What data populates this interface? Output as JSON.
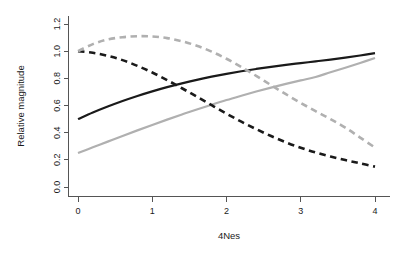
{
  "chart_data": {
    "type": "line",
    "title": "",
    "xlabel": "4Nes",
    "ylabel": "Relative magnitude",
    "xlim": [
      0,
      4
    ],
    "ylim": [
      0.0,
      1.2
    ],
    "xticks": [
      "0",
      "1",
      "2",
      "3",
      "4"
    ],
    "xtick_values": [
      0,
      1,
      2,
      3,
      4
    ],
    "yticks": [
      "0.0",
      "0.2",
      "0.4",
      "0.6",
      "0.8",
      "1.0",
      "1.2"
    ],
    "ytick_values": [
      0.0,
      0.2,
      0.4,
      0.6,
      0.8,
      1.0,
      1.2
    ],
    "grid": false,
    "legend": "none",
    "x": [
      0,
      0.2,
      0.4,
      0.6,
      0.8,
      1.0,
      1.2,
      1.4,
      1.6,
      1.8,
      2.0,
      2.2,
      2.4,
      2.6,
      2.8,
      3.0,
      3.2,
      3.4,
      3.6,
      3.8,
      4.0
    ],
    "series": [
      {
        "name": "black-solid",
        "color": "#1a1a1a",
        "style": "solid",
        "width": 2.2,
        "values": [
          0.5,
          0.548,
          0.592,
          0.633,
          0.67,
          0.704,
          0.735,
          0.763,
          0.789,
          0.812,
          0.833,
          0.852,
          0.869,
          0.885,
          0.899,
          0.912,
          0.925,
          0.938,
          0.952,
          0.968,
          0.985
        ]
      },
      {
        "name": "gray-solid",
        "color": "#b0b0b0",
        "style": "solid",
        "width": 2.2,
        "values": [
          0.25,
          0.292,
          0.334,
          0.376,
          0.417,
          0.457,
          0.496,
          0.534,
          0.571,
          0.606,
          0.64,
          0.672,
          0.703,
          0.732,
          0.759,
          0.785,
          0.81,
          0.845,
          0.878,
          0.913,
          0.95
        ]
      },
      {
        "name": "black-dashed",
        "color": "#1a1a1a",
        "style": "dashed",
        "width": 2.6,
        "values": [
          1.0,
          0.988,
          0.966,
          0.934,
          0.892,
          0.843,
          0.787,
          0.727,
          0.665,
          0.602,
          0.54,
          0.481,
          0.426,
          0.375,
          0.329,
          0.289,
          0.254,
          0.224,
          0.198,
          0.174,
          0.15
        ]
      },
      {
        "name": "gray-dashed",
        "color": "#b0b0b0",
        "style": "dashed",
        "width": 2.6,
        "values": [
          1.0,
          1.052,
          1.086,
          1.103,
          1.11,
          1.108,
          1.096,
          1.073,
          1.04,
          0.997,
          0.944,
          0.884,
          0.818,
          0.75,
          0.683,
          0.619,
          0.558,
          0.5,
          0.437,
          0.364,
          0.29
        ]
      }
    ]
  },
  "axes": {
    "ylabel": "Relative magnitude",
    "xlabel": "4Nes"
  },
  "colors": {
    "background": "#ffffff",
    "axis": "#555555",
    "text": "#1a1a1a",
    "dark_series": "#1a1a1a",
    "light_series": "#b0b0b0"
  }
}
